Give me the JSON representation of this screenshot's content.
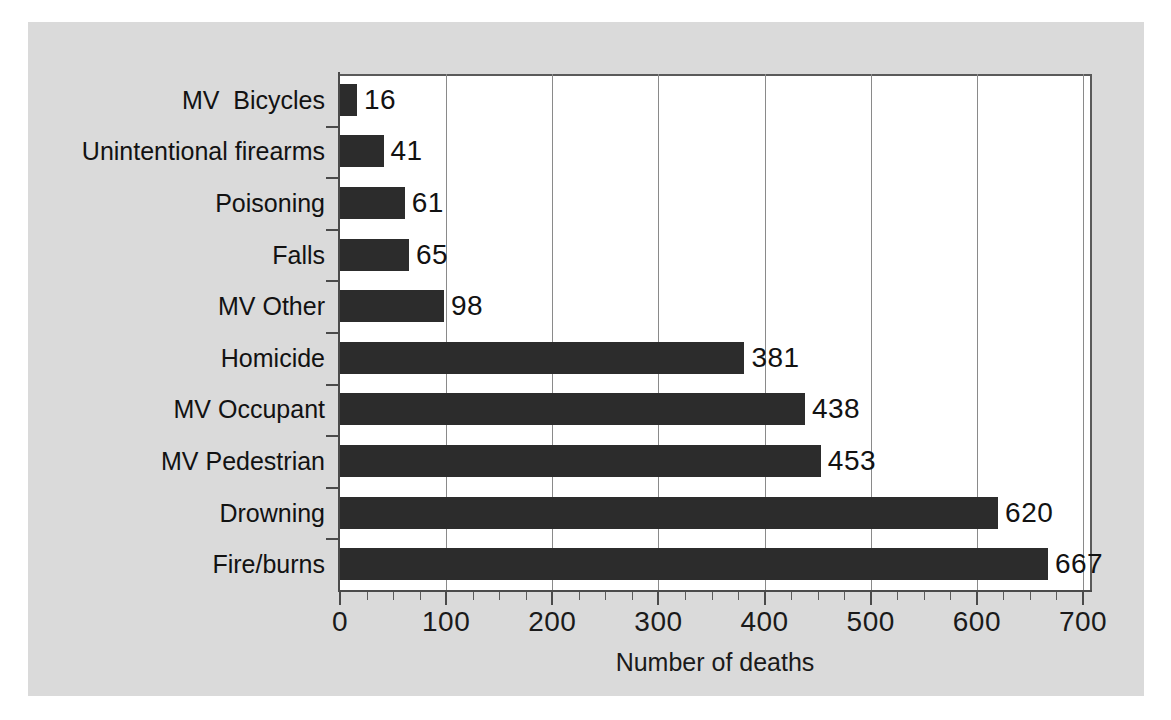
{
  "chart_data": {
    "type": "bar",
    "orientation": "horizontal",
    "title": "",
    "xlabel": "Number of deaths",
    "ylabel": "",
    "xlim": [
      0,
      700
    ],
    "xticks": [
      0,
      100,
      200,
      300,
      400,
      500,
      600,
      700
    ],
    "xtick_labels": [
      "0",
      "100",
      "200",
      "300",
      "400",
      "500",
      "600",
      "700"
    ],
    "minor_tick_step": 25,
    "grid": "vertical-major",
    "legend": "none",
    "bar_color": "#2c2c2c",
    "panel_color": "#dadada",
    "plot_color": "#ffffff",
    "categories": [
      "MV  Bicycles",
      "Unintentional firearms",
      "Poisoning",
      "Falls",
      "MV Other",
      "Homicide",
      "MV Occupant",
      "MV Pedestrian",
      "Drowning",
      "Fire/burns"
    ],
    "values": [
      16,
      41,
      61,
      65,
      98,
      381,
      438,
      453,
      620,
      667
    ],
    "value_labels": [
      "16",
      "41",
      "61",
      "65",
      "98",
      "381",
      "438",
      "453",
      "620",
      "667"
    ]
  }
}
